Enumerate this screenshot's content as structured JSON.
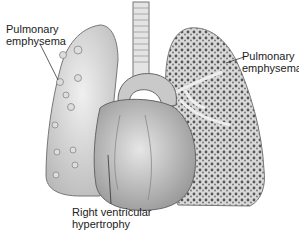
{
  "figure": {
    "labels": {
      "left_lung": {
        "line1": "Pulmonary",
        "line2": "emphysema"
      },
      "right_lung": {
        "line1": "Pulmonary",
        "line2": "emphysema"
      },
      "heart": {
        "line1": "Right ventricular",
        "line2": "hypertrophy"
      }
    }
  }
}
